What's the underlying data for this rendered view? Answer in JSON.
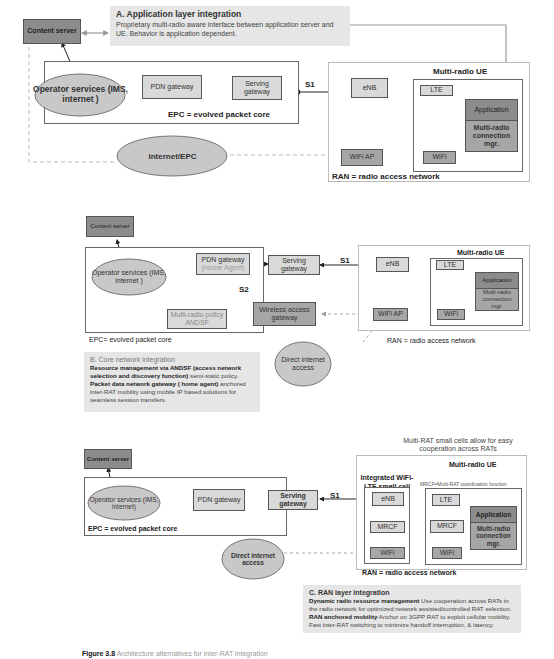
{
  "panel_a": {
    "content_server": "Content server",
    "note_title": "A. Application layer integration",
    "note_body": "Proprietary multi-radio aware interface between application server and UE. Behavior is application dependent.",
    "operator_services": "Operator services (IMS, internet )",
    "pdn_gateway": "PDN gateway",
    "serving_gateway": "Serving gateway",
    "s1": "S1",
    "epc_label": "EPC = evolved packet core",
    "internet_epc": "Internet/EPC",
    "enb": "eNB",
    "lte": "LTE",
    "wifi_ap": "WiFi AP",
    "wifi": "WiFi",
    "ue_title": "Multi-radio UE",
    "application": "Application",
    "mrcm": "Multi-radio connection mgr.",
    "ran_label": "RAN = radio access network"
  },
  "panel_b": {
    "content_server": "Content server",
    "operator_services": "Operator services (IMS, internet )",
    "pdn_gateway": "PDN gateway",
    "home_agent": "(Home Agent)",
    "serving_gateway": "Serving gateway",
    "s1": "S1",
    "s2": "S2",
    "policy": "Multi-radio policy ANDSF",
    "wag": "Wireless access gateway",
    "epc_label": "EPC= evolved packet core",
    "enb": "eNB",
    "lte": "LTE",
    "wifi_ap": "WiFi AP",
    "wifi": "WiFi",
    "ue_title": "Multi-radio UE",
    "application": "Application",
    "mrcm": "Multi-radio connection mgr.",
    "ran_label": "RAN = radio access network",
    "direct_internet": "Direct internet access",
    "note_title": "B. Core network integration",
    "note_l1_bold": "Resource management  via ANDSF (access network selection and discovery function)",
    "note_l1_rest": " semi-static policy.",
    "note_l2_bold": "Packet  data  network gateway ( home agent)",
    "note_l2_rest": " anchored inter-RAT mobility using  mobile IP based solutions for seamless session transfers."
  },
  "panel_c": {
    "content_server": "Content server",
    "operator_services": "Operator services (IMS, internet)",
    "pdn_gateway": "PDN gateway",
    "serving_gateway": "Serving gateway",
    "s1": "S1",
    "epc_label": "EPC = evolved packet core",
    "direct_internet": "Direct internet access",
    "small_cell_note": "Multi-RAT small cells allow for easy cooperation across RATs",
    "ue_title": "Multi-radio UE",
    "small_cell_title": "Integrated WiFi-LTE small cell",
    "mrcf_def": "MRCF=Multi-RAT coordination function",
    "enb": "eNB",
    "mrcf_cell": "MRCF",
    "wifi_cell": "WiFi",
    "lte": "LTE",
    "mrcf_ue": "MRCF",
    "wifi_ue": "WiFi",
    "application": "Application",
    "mrcm": "Multi-radio connection mgr.",
    "ran_label": "RAN = radio access network",
    "note_title": "C. RAN layer integration",
    "note_l1_bold": "Dynamic radio resource management",
    "note_l1_rest": " Use cooperation across RATs in the radio network for optimized network assisted/controlled RAT selection.",
    "note_l2_bold": "RAN anchored mobility",
    "note_l2_rest": " Anchor on 3GPP RAT to exploit cellular mobility. Fast inter-RAT switching to minimize handoff interruption, & latency."
  },
  "caption": {
    "prefix": "Figure 3.8",
    "text": "Architecture alternatives for inter-RAT integration"
  },
  "colors": {
    "dark_box": "#8c8c8c",
    "light_box": "#d9d9d9",
    "cloud": "#c8c8c8",
    "note_bg": "#e6e6e6"
  }
}
